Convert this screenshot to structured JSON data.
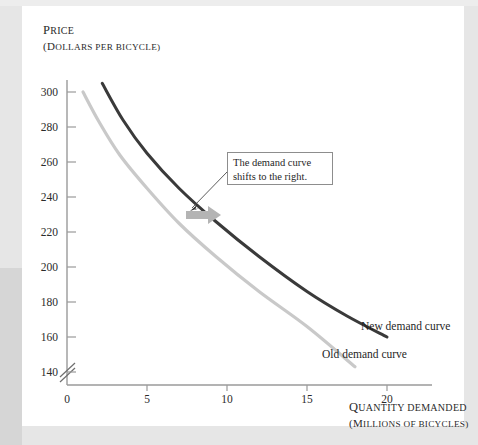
{
  "figure": {
    "panel_background": "#ffffff",
    "page_background": "#e6e6e6",
    "band_color": "#d6d6d6"
  },
  "axes": {
    "y_title_lead": "P",
    "y_title_rest": "RICE",
    "y_subtitle_lead": "(D",
    "y_subtitle_rest": "OLLARS PER BICYCLE)",
    "x_title_lead": "Q",
    "x_title_rest": "UANTITY DEMANDED",
    "x_subtitle_lead": "(M",
    "x_subtitle_rest": "ILLIONS OF BICYCLES)",
    "origin_label": "0",
    "y_ticks": [
      "300",
      "280",
      "260",
      "240",
      "220",
      "200",
      "180",
      "160",
      "140"
    ],
    "x_ticks": [
      "0",
      "5",
      "10",
      "15",
      "20"
    ],
    "axis_break": true,
    "axis_color": "#9a9a9a"
  },
  "annotation": {
    "line1": "The demand curve",
    "line2": "shifts to the right.",
    "border_color": "#8d8d8d"
  },
  "labels": {
    "new_curve": "New demand curve",
    "old_curve": "Old demand curve"
  },
  "shift_arrow": {
    "color": "#b4b4b4",
    "direction": "right"
  },
  "chart_data": {
    "type": "line",
    "title": "",
    "xlabel": "QUANTITY DEMANDED (MILLIONS OF BICYCLES)",
    "ylabel": "PRICE (DOLLARS PER BICYCLE)",
    "xlim": [
      0,
      21
    ],
    "ylim": [
      130,
      310
    ],
    "xticks": [
      0,
      5,
      10,
      15,
      20
    ],
    "yticks": [
      140,
      160,
      180,
      200,
      220,
      240,
      260,
      280,
      300
    ],
    "grid": false,
    "legend": "inline-labels",
    "annotations": [
      {
        "text": "The demand curve shifts to the right.",
        "points_to": [
          9.0,
          222
        ]
      }
    ],
    "series": [
      {
        "name": "Old demand curve",
        "color": "#c9c9c9",
        "x": [
          1.0,
          2.0,
          3.3,
          5.0,
          7.0,
          9.3,
          12.0,
          15.0,
          18.0
        ],
        "y": [
          300,
          283,
          264,
          245,
          225,
          206,
          186,
          166,
          143
        ]
      },
      {
        "name": "New demand curve",
        "color": "#3a3a3a",
        "x": [
          2.2,
          3.5,
          5.0,
          7.0,
          9.3,
          12.0,
          15.0,
          17.5,
          20.0
        ],
        "y": [
          305,
          284,
          265,
          245,
          226,
          206,
          186,
          172,
          160
        ]
      }
    ]
  }
}
